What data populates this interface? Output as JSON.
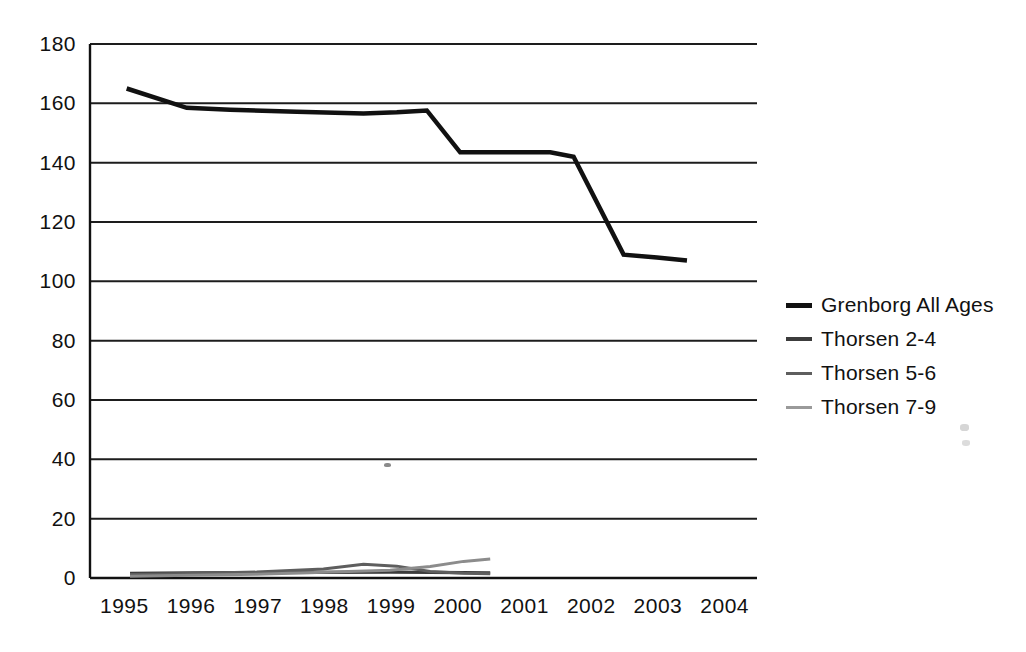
{
  "chart_data": {
    "type": "line",
    "title": "",
    "xlabel": "",
    "ylabel": "",
    "xlim": [
      1994.5,
      2004.5
    ],
    "ylim": [
      0,
      180
    ],
    "yticks": [
      0,
      20,
      40,
      60,
      80,
      100,
      120,
      140,
      160,
      180
    ],
    "xticks": [
      1995,
      1996,
      1997,
      1998,
      1999,
      2000,
      2001,
      2002,
      2003,
      2004
    ],
    "grid": "horizontal",
    "legend_position": "right",
    "series": [
      {
        "name": "Grenborg All Ages",
        "color": "#111111",
        "width": 4.5,
        "x": [
          1995.05,
          1995.95,
          1996.6,
          1997.6,
          1998.6,
          1999.1,
          1999.55,
          2000.05,
          2001.4,
          2001.75,
          2002.5,
          2003.0,
          2003.45
        ],
        "values": [
          165.0,
          158.5,
          157.8,
          157.2,
          156.6,
          157.0,
          157.6,
          143.5,
          143.5,
          142.0,
          109.0,
          108.0,
          107.0
        ]
      },
      {
        "name": "Thorsen 2-4",
        "color": "#3c3c3c",
        "width": 3.2,
        "x": [
          1995.1,
          1996.0,
          1997.0,
          1998.0,
          1999.0,
          1999.6,
          2000.1,
          2000.5
        ],
        "values": [
          1.6,
          1.7,
          1.8,
          1.9,
          2.0,
          1.9,
          1.8,
          1.7
        ]
      },
      {
        "name": "Thorsen 5-6",
        "color": "#5e5e5e",
        "width": 3.0,
        "x": [
          1995.1,
          1996.0,
          1997.0,
          1998.0,
          1998.6,
          1999.1,
          1999.6,
          2000.1,
          2000.5
        ],
        "values": [
          1.2,
          1.5,
          2.0,
          3.0,
          4.6,
          4.0,
          2.2,
          1.6,
          1.4
        ]
      },
      {
        "name": "Thorsen 7-9",
        "color": "#8c8c8c",
        "width": 3.0,
        "x": [
          1995.1,
          1996.0,
          1997.0,
          1998.0,
          1999.0,
          1999.6,
          2000.1,
          2000.5
        ],
        "values": [
          0.6,
          0.9,
          1.3,
          1.9,
          2.6,
          3.9,
          5.6,
          6.4
        ]
      }
    ]
  },
  "axes": {
    "ytick_labels": [
      "180",
      "160",
      "140",
      "120",
      "100",
      "80",
      "60",
      "40",
      "20",
      "0"
    ],
    "xtick_labels": [
      "1995",
      "1996",
      "1997",
      "1998",
      "1999",
      "2000",
      "2001",
      "2002",
      "2003",
      "2004"
    ]
  },
  "legend": {
    "entries": [
      {
        "label": "Grenborg All Ages",
        "color": "#111111",
        "thickness": "5px"
      },
      {
        "label": "Thorsen 2-4",
        "color": "#3c3c3c",
        "thickness": "4px"
      },
      {
        "label": "Thorsen 5-6",
        "color": "#5e5e5e",
        "thickness": "3px"
      },
      {
        "label": "Thorsen 7-9",
        "color": "#9a9a9a",
        "thickness": "3px"
      }
    ]
  },
  "colors": {
    "background": "#ffffff",
    "axis": "#111111",
    "grid": "#1d1d1d",
    "text": "#111111"
  }
}
